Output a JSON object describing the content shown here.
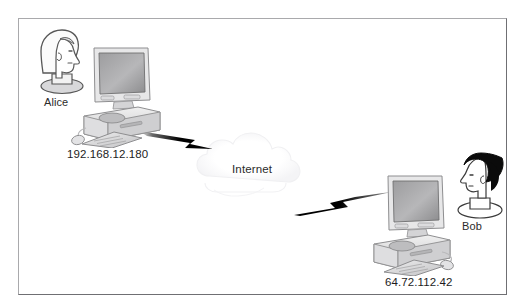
{
  "diagram": {
    "background_color": "#ffffff",
    "border_color": "#a9a9ac",
    "border_shadow_color": "#6f6f73",
    "text_color": "#2b2b2b",
    "link_color": "#000000",
    "cloud": {
      "label": "Internet",
      "outline_color": "#f2f2f4",
      "fill_color": "#fdfdfd"
    },
    "nodes": [
      {
        "id": "alice",
        "name": "Alice",
        "ip": "192.168.12.180",
        "person_icon": "person-head-light-hair-facing-right",
        "computer_icon": "desktop-computer",
        "hair_color": "#ffffff",
        "outline_color": "#585858"
      },
      {
        "id": "bob",
        "name": "Bob",
        "ip": "64.72.112.42",
        "person_icon": "person-head-dark-hair-facing-left",
        "computer_icon": "desktop-computer",
        "hair_color": "#0b0b0b",
        "outline_color": "#3a3a3a"
      }
    ],
    "links": [
      {
        "id": "alice-to-internet",
        "from": "alice",
        "to": "internet",
        "style": "lightning-bolt"
      },
      {
        "id": "internet-to-bob",
        "from": "internet",
        "to": "bob",
        "style": "lightning-bolt"
      }
    ]
  }
}
